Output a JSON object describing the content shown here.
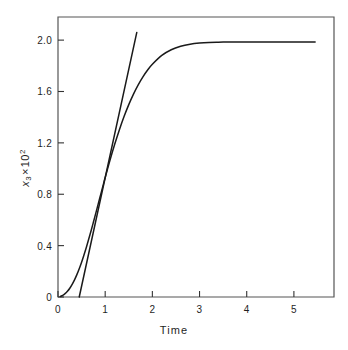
{
  "chart_data": {
    "type": "line",
    "title": "",
    "subtitle": "",
    "xlabel": "Time",
    "ylabel": "x_3 x 10^2",
    "ylabel_parts": {
      "variable": "x",
      "subscript": "3",
      "multiplier_symbol": "×",
      "base": "10",
      "exponent": "2"
    },
    "xlim": [
      0,
      5.85
    ],
    "ylim": [
      0,
      2.18
    ],
    "grid": false,
    "legend": null,
    "xticks": [
      0,
      1,
      2,
      3,
      4,
      5
    ],
    "xticklabels": [
      "0",
      "1",
      "2",
      "3",
      "4",
      "5"
    ],
    "yticks": [
      0,
      0.4,
      0.8,
      1.2,
      1.6,
      2.0
    ],
    "yticklabels": [
      "0",
      "0.4",
      "0.8",
      "1.2",
      "1.6",
      "2.0"
    ],
    "annotations": [],
    "series": [
      {
        "name": "sigmoid-response",
        "kind": "curve",
        "color": "#1a1a1a",
        "asymptote": 1.985,
        "x": [
          0.05,
          0.1,
          0.15,
          0.2,
          0.25,
          0.3,
          0.35,
          0.4,
          0.45,
          0.5,
          0.55,
          0.6,
          0.65,
          0.7,
          0.75,
          0.8,
          0.85,
          0.9,
          0.95,
          1.0,
          1.1,
          1.2,
          1.3,
          1.4,
          1.5,
          1.6,
          1.7,
          1.8,
          1.9,
          2.0,
          2.2,
          2.4,
          2.6,
          2.8,
          3.0,
          3.2,
          3.4,
          3.6,
          3.8,
          4.0,
          4.4,
          4.8,
          5.2,
          5.45
        ],
        "y": [
          0.005,
          0.013,
          0.026,
          0.044,
          0.068,
          0.098,
          0.133,
          0.174,
          0.22,
          0.271,
          0.327,
          0.386,
          0.449,
          0.514,
          0.582,
          0.651,
          0.721,
          0.791,
          0.861,
          0.93,
          1.063,
          1.187,
          1.301,
          1.405,
          1.498,
          1.58,
          1.652,
          1.714,
          1.767,
          1.812,
          1.881,
          1.925,
          1.952,
          1.968,
          1.977,
          1.982,
          1.984,
          1.985,
          1.985,
          1.985,
          1.985,
          1.985,
          1.985,
          1.985
        ]
      },
      {
        "name": "tangent-line",
        "kind": "line",
        "color": "#1a1a1a",
        "x_intercept": 0.45,
        "x": [
          0.45,
          1.67
        ],
        "y": [
          0.0,
          2.06
        ]
      }
    ]
  },
  "axes": {
    "frame_color": "#555555",
    "tick_color": "#333333",
    "line_color": "#1a1a1a"
  }
}
